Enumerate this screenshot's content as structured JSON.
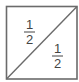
{
  "diagram": {
    "colors": {
      "stroke": "#6b6b6b",
      "text": "#444444",
      "background": "#ffffff"
    },
    "regions": [
      {
        "name": "upper-left-triangle",
        "label": {
          "numerator": "1",
          "denominator": "2"
        }
      },
      {
        "name": "lower-right-triangle",
        "label": {
          "numerator": "1",
          "denominator": "2"
        }
      }
    ]
  }
}
